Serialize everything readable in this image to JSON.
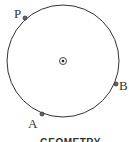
{
  "diagram": {
    "caption": "GEOMETRY",
    "circle": {
      "cx": 63,
      "cy": 61,
      "r": 56,
      "stroke": "#333333"
    },
    "center_marker": {
      "x": 63,
      "y": 61
    },
    "points": [
      {
        "label": "P",
        "x": 25,
        "y": 18
      },
      {
        "label": "B",
        "x": 116,
        "y": 84
      },
      {
        "label": "A",
        "x": 42,
        "y": 114
      }
    ]
  }
}
